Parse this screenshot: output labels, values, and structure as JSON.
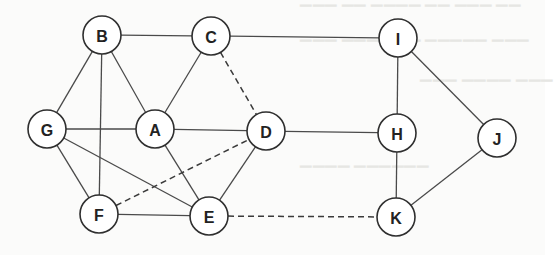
{
  "diagram": {
    "type": "undirected-graph",
    "node_radius": 19,
    "colors": {
      "stroke": "#2f2f2f",
      "node_fill": "#ffffff",
      "background": "#fbfbfa"
    },
    "nodes": [
      {
        "id": "B",
        "label": "B",
        "x": 102,
        "y": 35
      },
      {
        "id": "C",
        "label": "C",
        "x": 211,
        "y": 36
      },
      {
        "id": "I",
        "label": "I",
        "x": 398,
        "y": 38
      },
      {
        "id": "G",
        "label": "G",
        "x": 47,
        "y": 129
      },
      {
        "id": "A",
        "label": "A",
        "x": 155,
        "y": 129
      },
      {
        "id": "D",
        "label": "D",
        "x": 266,
        "y": 131
      },
      {
        "id": "H",
        "label": "H",
        "x": 397,
        "y": 133
      },
      {
        "id": "J",
        "label": "J",
        "x": 497,
        "y": 138
      },
      {
        "id": "F",
        "label": "F",
        "x": 99,
        "y": 214
      },
      {
        "id": "E",
        "label": "E",
        "x": 209,
        "y": 216
      },
      {
        "id": "K",
        "label": "K",
        "x": 396,
        "y": 217
      }
    ],
    "edges": [
      {
        "from": "B",
        "to": "C",
        "style": "solid"
      },
      {
        "from": "C",
        "to": "I",
        "style": "solid"
      },
      {
        "from": "B",
        "to": "G",
        "style": "solid"
      },
      {
        "from": "B",
        "to": "F",
        "style": "solid"
      },
      {
        "from": "B",
        "to": "A",
        "style": "solid"
      },
      {
        "from": "C",
        "to": "A",
        "style": "solid"
      },
      {
        "from": "C",
        "to": "D",
        "style": "dashed"
      },
      {
        "from": "G",
        "to": "A",
        "style": "solid"
      },
      {
        "from": "A",
        "to": "D",
        "style": "solid"
      },
      {
        "from": "D",
        "to": "H",
        "style": "solid"
      },
      {
        "from": "G",
        "to": "F",
        "style": "solid"
      },
      {
        "from": "G",
        "to": "E",
        "style": "solid"
      },
      {
        "from": "A",
        "to": "E",
        "style": "solid"
      },
      {
        "from": "D",
        "to": "E",
        "style": "solid"
      },
      {
        "from": "F",
        "to": "D",
        "style": "dashed"
      },
      {
        "from": "F",
        "to": "E",
        "style": "solid"
      },
      {
        "from": "E",
        "to": "K",
        "style": "dashed"
      },
      {
        "from": "I",
        "to": "H",
        "style": "solid"
      },
      {
        "from": "I",
        "to": "J",
        "style": "solid"
      },
      {
        "from": "H",
        "to": "K",
        "style": "solid"
      },
      {
        "from": "J",
        "to": "K",
        "style": "solid"
      }
    ]
  }
}
